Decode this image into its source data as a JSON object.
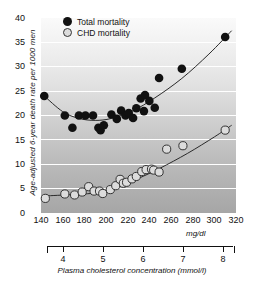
{
  "chart_data": {
    "type": "scatter",
    "title": "",
    "xlabel": "Plasma cholesterol concentration (mmol/l)",
    "ylabel": "Age-adjusted 6-year death rate per 1000 men",
    "x_unit_primary": "mg/dl",
    "x_unit_secondary": "mmol/l",
    "xlim": [
      140,
      320
    ],
    "ylim": [
      0,
      40
    ],
    "xticks": [
      140,
      160,
      180,
      200,
      220,
      240,
      260,
      280,
      300,
      320
    ],
    "yticks": [
      0,
      5,
      10,
      15,
      20,
      25,
      30,
      35,
      40
    ],
    "secondary_xlim": [
      3.62,
      8.27
    ],
    "secondary_xticks": [
      4,
      5,
      6,
      7,
      8
    ],
    "grid": "horizontal-white",
    "legend_position": "top-center",
    "series": [
      {
        "name": "Total mortality",
        "marker": "filled-circle",
        "color": "#111111",
        "points": [
          [
            143,
            24.0
          ],
          [
            162,
            20.0
          ],
          [
            169,
            17.5
          ],
          [
            175,
            20.0
          ],
          [
            181,
            20.0
          ],
          [
            188,
            20.0
          ],
          [
            193,
            17.5
          ],
          [
            195,
            17.0
          ],
          [
            198,
            18.0
          ],
          [
            205,
            20.2
          ],
          [
            210,
            19.3
          ],
          [
            214,
            21.0
          ],
          [
            218,
            20.0
          ],
          [
            221,
            20.5
          ],
          [
            225,
            19.5
          ],
          [
            228,
            21.5
          ],
          [
            232,
            23.5
          ],
          [
            235,
            20.9
          ],
          [
            236,
            24.2
          ],
          [
            240,
            23.0
          ],
          [
            245,
            21.6
          ],
          [
            249,
            27.7
          ],
          [
            270,
            29.6
          ],
          [
            310,
            36.1
          ]
        ]
      },
      {
        "name": "CHD mortality",
        "marker": "open-circle",
        "color": "#dcdcdc",
        "edge_color": "#333333",
        "points": [
          [
            144,
            3.0
          ],
          [
            162,
            3.9
          ],
          [
            171,
            3.7
          ],
          [
            178,
            4.3
          ],
          [
            184,
            5.4
          ],
          [
            189,
            4.5
          ],
          [
            194,
            4.5
          ],
          [
            197,
            4.0
          ],
          [
            204,
            4.8
          ],
          [
            209,
            5.6
          ],
          [
            213,
            6.9
          ],
          [
            216,
            6.1
          ],
          [
            219,
            6.3
          ],
          [
            224,
            7.0
          ],
          [
            228,
            7.5
          ],
          [
            233,
            8.5
          ],
          [
            237,
            8.9
          ],
          [
            242,
            9.0
          ],
          [
            244,
            8.8
          ],
          [
            249,
            8.4
          ],
          [
            256,
            13.1
          ],
          [
            271,
            13.8
          ],
          [
            310,
            17.0
          ]
        ]
      }
    ],
    "fitted_curves": [
      {
        "series": "Total mortality",
        "description": "U-shaped curve: declines from ~24 at 143 to minimum ~19 near 190, then rises to ~37.5 at 316"
      },
      {
        "series": "CHD mortality",
        "description": "Flat near 3.5-4 until ~200, then rises steadily to ~18 at 316"
      }
    ]
  },
  "legend": {
    "items": [
      {
        "label": "Total mortality",
        "marker": "filled-circle"
      },
      {
        "label": "CHD mortality",
        "marker": "open-circle"
      }
    ]
  },
  "axes": {
    "y_title": "Age-adjusted 6-year death rate per 1000 men",
    "x_title_secondary": "Plasma cholesterol concentration (mmol/l)",
    "x_unit_note": "mg/dl",
    "y_tick_labels": [
      "40",
      "35",
      "30",
      "25",
      "20",
      "15",
      "10",
      "5",
      "0"
    ],
    "x_tick_labels": [
      "140",
      "160",
      "180",
      "200",
      "220",
      "240",
      "260",
      "280",
      "300",
      "320"
    ],
    "secondary_tick_labels": [
      "4",
      "5",
      "6",
      "7",
      "8"
    ]
  }
}
